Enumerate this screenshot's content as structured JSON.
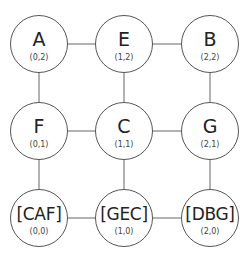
{
  "diagram": {
    "nodes": [
      {
        "id": "A",
        "label": "A",
        "coord": "(0,2)",
        "cx": 39,
        "cy": 44
      },
      {
        "id": "E",
        "label": "E",
        "coord": "(1,2)",
        "cx": 124,
        "cy": 44
      },
      {
        "id": "B",
        "label": "B",
        "coord": "(2,2)",
        "cx": 210,
        "cy": 44
      },
      {
        "id": "F",
        "label": "F",
        "coord": "(0,1)",
        "cx": 39,
        "cy": 131
      },
      {
        "id": "C",
        "label": "C",
        "coord": "(1,1)",
        "cx": 124,
        "cy": 131
      },
      {
        "id": "G",
        "label": "G",
        "coord": "(2,1)",
        "cx": 210,
        "cy": 131
      },
      {
        "id": "CAF",
        "label": "[CAF]",
        "coord": "(0,0)",
        "cx": 39,
        "cy": 218
      },
      {
        "id": "GEC",
        "label": "[GEC]",
        "coord": "(1,0)",
        "cx": 124,
        "cy": 218
      },
      {
        "id": "DBG",
        "label": "[DBG]",
        "coord": "(2,0)",
        "cx": 210,
        "cy": 218
      }
    ],
    "edges": [
      [
        "A",
        "E"
      ],
      [
        "E",
        "B"
      ],
      [
        "A",
        "F"
      ],
      [
        "E",
        "C"
      ],
      [
        "B",
        "G"
      ],
      [
        "F",
        "C"
      ],
      [
        "C",
        "G"
      ],
      [
        "F",
        "CAF"
      ],
      [
        "C",
        "GEC"
      ],
      [
        "G",
        "DBG"
      ],
      [
        "CAF",
        "GEC"
      ],
      [
        "GEC",
        "DBG"
      ]
    ]
  }
}
